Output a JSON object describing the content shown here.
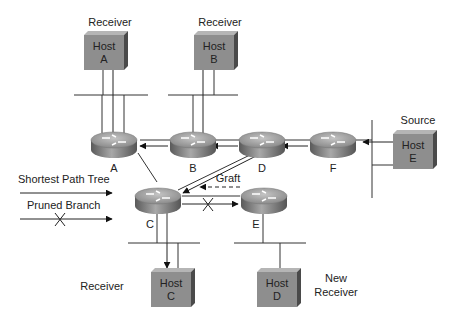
{
  "diagram": {
    "colors": {
      "line": "#333333",
      "host_front": "#8e8e8e",
      "host_top": "#b8b8b8",
      "host_side": "#4a4a4a",
      "router_top": "#9a9a9a",
      "router_side": "#6e6e6e"
    },
    "hosts": [
      {
        "id": "A",
        "line1": "Host",
        "line2": "A",
        "role": "Receiver"
      },
      {
        "id": "B",
        "line1": "Host",
        "line2": "B",
        "role": "Receiver"
      },
      {
        "id": "C",
        "line1": "Host",
        "line2": "C",
        "role": "Receiver"
      },
      {
        "id": "D",
        "line1": "Host",
        "line2": "D",
        "role_line1": "New",
        "role_line2": "Receiver"
      },
      {
        "id": "E",
        "line1": "Host",
        "line2": "E",
        "role": "Source"
      }
    ],
    "routers": [
      {
        "id": "A",
        "label": "A"
      },
      {
        "id": "B",
        "label": "B"
      },
      {
        "id": "C",
        "label": "C"
      },
      {
        "id": "D",
        "label": "D"
      },
      {
        "id": "E",
        "label": "E"
      },
      {
        "id": "F",
        "label": "F"
      }
    ],
    "annotations": {
      "graft": "Graft"
    },
    "legend": {
      "shortest_path_tree": "Shortest Path Tree",
      "pruned_branch": "Pruned Branch"
    }
  }
}
